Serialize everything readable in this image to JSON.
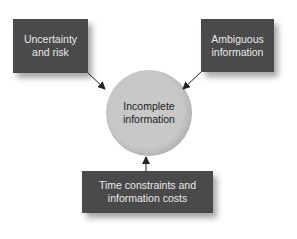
{
  "diagram": {
    "center": {
      "label": "Incomplete\ninformation"
    },
    "factors": [
      {
        "label": "Uncertainty\nand risk"
      },
      {
        "label": "Ambiguous\ninformation"
      },
      {
        "label": "Time constraints and\ninformation costs"
      }
    ]
  },
  "colors": {
    "box_fill": "#4a4a4a",
    "box_text": "#e8e8e8",
    "circle_fill": "#c8c8c8",
    "arrow": "#222222"
  }
}
